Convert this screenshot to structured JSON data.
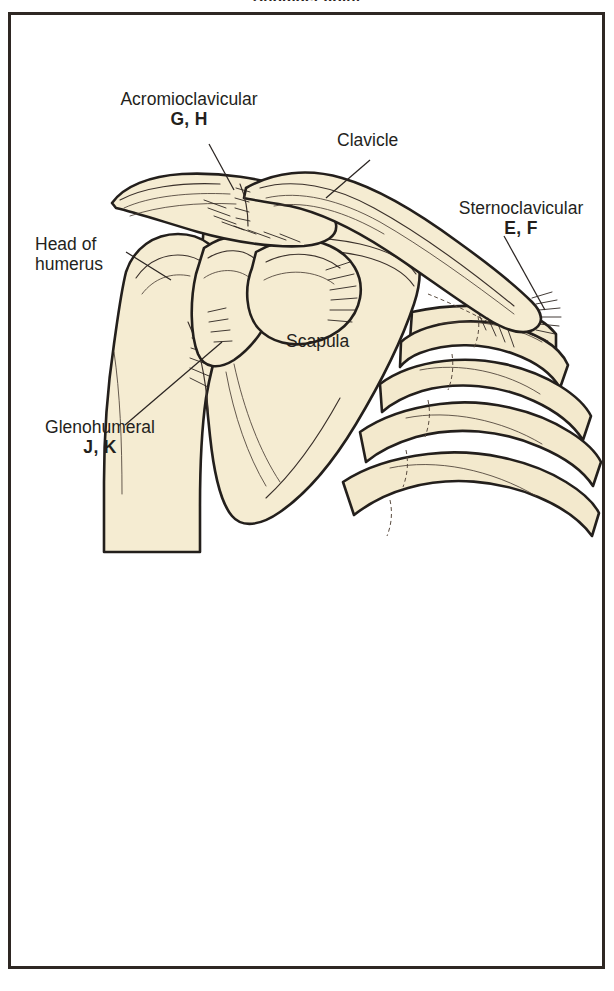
{
  "figure": {
    "title": "Shoulder Joint",
    "frame_color": "#2e2723",
    "background_color": "#ffffff",
    "bone_fill_color": "#f5ecd2",
    "bone_outline_color": "#231f1c",
    "text_color": "#241f1c"
  },
  "labels": {
    "acromioclavicular": {
      "name": "Acromioclavicular",
      "code": "G, H"
    },
    "clavicle": {
      "name": "Clavicle"
    },
    "sternoclavicular": {
      "name": "Sternoclavicular",
      "code": "E, F"
    },
    "head_of_humerus": {
      "line1": "Head of",
      "line2": "humerus"
    },
    "glenohumeral": {
      "name": "Glenohumeral",
      "code": "J, K"
    },
    "scapula": {
      "name": "Scapula"
    }
  }
}
